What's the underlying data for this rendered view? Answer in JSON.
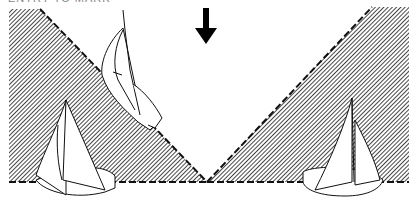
{
  "caption": "ENTRY TO MARK",
  "colors": {
    "hatch": "#333333",
    "background": "#ffffff",
    "line": "#111111"
  },
  "figure": {
    "arrow": "down-arrow",
    "zones": [
      "left-hatched-zone",
      "right-hatched-zone"
    ],
    "boats": [
      "boat-upper-left",
      "boat-lower-left",
      "boat-right"
    ]
  }
}
